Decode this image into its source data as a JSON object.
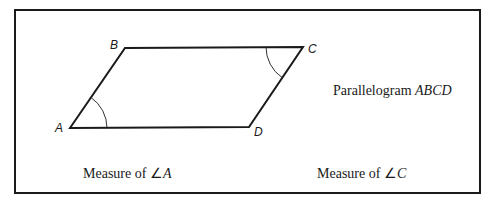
{
  "figure": {
    "title": "Parallelogram",
    "title_name": "ABCD",
    "vertices": {
      "A": {
        "label": "A",
        "x": 70,
        "y": 128
      },
      "B": {
        "label": "B",
        "x": 125,
        "y": 48
      },
      "C": {
        "label": "C",
        "x": 303,
        "y": 47
      },
      "D": {
        "label": "D",
        "x": 249,
        "y": 127
      }
    },
    "marked_angles": [
      "A",
      "C"
    ]
  },
  "captions": {
    "left": {
      "prefix": "Measure of ",
      "angle_symbol": "∠",
      "vertex": "A"
    },
    "right": {
      "prefix": "Measure of ",
      "angle_symbol": "∠",
      "vertex": "C"
    }
  },
  "colors": {
    "stroke": "#1a1a1a",
    "background": "#ffffff"
  }
}
